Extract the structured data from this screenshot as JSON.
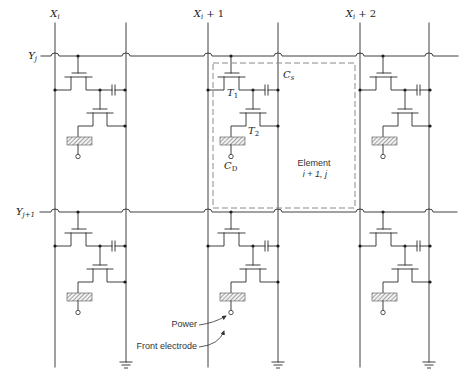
{
  "figure": {
    "columns": [
      {
        "symbol": "X",
        "subscript": "i",
        "suffix": ""
      },
      {
        "symbol": "X",
        "subscript": "i",
        "suffix": " + 1"
      },
      {
        "symbol": "X",
        "subscript": "i",
        "suffix": " + 2"
      }
    ],
    "rows": [
      {
        "symbol": "Y",
        "subscript": "j"
      },
      {
        "symbol": "Y",
        "subscript": "j+1"
      }
    ],
    "component_labels": {
      "storage_capacitor": {
        "symbol": "C",
        "subscript": "s"
      },
      "transistor_1": {
        "symbol": "T",
        "subscript": "1"
      },
      "transistor_2": {
        "symbol": "T",
        "subscript": "2"
      },
      "display_capacitor": {
        "symbol": "C",
        "subscript": "D"
      }
    },
    "element_label": {
      "line1": "Element",
      "line2": "i + 1, j"
    },
    "annotations": {
      "power": "Power",
      "front_electrode": "Front electrode"
    }
  }
}
